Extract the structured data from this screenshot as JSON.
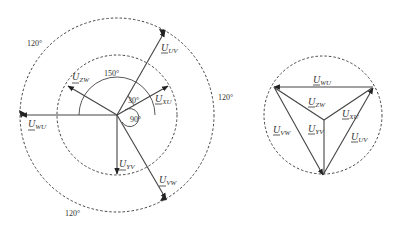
{
  "left_diagram": {
    "title": "Phasor diagram (delta-star transformer voltages)",
    "vectors": [
      {
        "id": "uv",
        "main": "U",
        "sub": "UV"
      },
      {
        "id": "xu",
        "main": "U",
        "sub": "XU"
      },
      {
        "id": "zw",
        "main": "U",
        "sub": "ZW"
      },
      {
        "id": "wu",
        "main": "U",
        "sub": "WU"
      },
      {
        "id": "yv",
        "main": "U",
        "sub": "YV"
      },
      {
        "id": "vw",
        "main": "U",
        "sub": "VW"
      }
    ],
    "angles": {
      "a150": "150°",
      "a30": "30°",
      "a90": "90°",
      "outer_top_left": "120°",
      "outer_right": "120°",
      "outer_bottom": "120°"
    }
  },
  "right_diagram": {
    "title": "Voltage triangle with star",
    "vectors": [
      {
        "id": "wu",
        "main": "U",
        "sub": "WU"
      },
      {
        "id": "zw",
        "main": "U",
        "sub": "ZW"
      },
      {
        "id": "xu",
        "main": "U",
        "sub": "XU"
      },
      {
        "id": "vw",
        "main": "U",
        "sub": "VW"
      },
      {
        "id": "yv",
        "main": "U",
        "sub": "YV"
      },
      {
        "id": "uv",
        "main": "U",
        "sub": "UV"
      }
    ]
  }
}
